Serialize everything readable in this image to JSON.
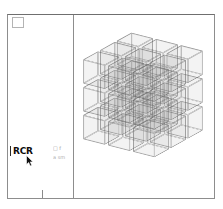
{
  "window": {
    "background_color": "#ffffff",
    "border_color": "#8d8d8d"
  },
  "sidebar": {
    "corner_box_name": "corner-box",
    "label": "RCR",
    "tick_mark": "|",
    "notes": [
      "□ f",
      "a sm"
    ]
  },
  "content": {
    "cursor": "arrow-cursor"
  },
  "chart_data": {
    "type": "scatter",
    "title": "",
    "xlabel": "",
    "ylabel": "",
    "render": "3d-wireframe-cube-lattice",
    "grid": [
      3,
      3,
      3
    ],
    "cube_count": 27,
    "cube_size": 26,
    "spacing": 30,
    "rotation_x_deg": -22,
    "rotation_y_deg": -34,
    "edge_color": "#606060",
    "edge_opacity": 0.4,
    "face_color": "#8c8c8c",
    "face_opacity": 0.055,
    "cubes": [
      {
        "i": 0,
        "j": 0,
        "k": 0
      },
      {
        "i": 1,
        "j": 0,
        "k": 0
      },
      {
        "i": 2,
        "j": 0,
        "k": 0
      },
      {
        "i": 0,
        "j": 1,
        "k": 0
      },
      {
        "i": 1,
        "j": 1,
        "k": 0
      },
      {
        "i": 2,
        "j": 1,
        "k": 0
      },
      {
        "i": 0,
        "j": 2,
        "k": 0
      },
      {
        "i": 1,
        "j": 2,
        "k": 0
      },
      {
        "i": 2,
        "j": 2,
        "k": 0
      },
      {
        "i": 0,
        "j": 0,
        "k": 1
      },
      {
        "i": 1,
        "j": 0,
        "k": 1
      },
      {
        "i": 2,
        "j": 0,
        "k": 1
      },
      {
        "i": 0,
        "j": 1,
        "k": 1
      },
      {
        "i": 1,
        "j": 1,
        "k": 1
      },
      {
        "i": 2,
        "j": 1,
        "k": 1
      },
      {
        "i": 0,
        "j": 2,
        "k": 1
      },
      {
        "i": 1,
        "j": 2,
        "k": 1
      },
      {
        "i": 2,
        "j": 2,
        "k": 1
      },
      {
        "i": 0,
        "j": 0,
        "k": 2
      },
      {
        "i": 1,
        "j": 0,
        "k": 2
      },
      {
        "i": 2,
        "j": 0,
        "k": 2
      },
      {
        "i": 0,
        "j": 1,
        "k": 2
      },
      {
        "i": 1,
        "j": 1,
        "k": 2
      },
      {
        "i": 2,
        "j": 1,
        "k": 2
      },
      {
        "i": 0,
        "j": 2,
        "k": 2
      },
      {
        "i": 1,
        "j": 2,
        "k": 2
      },
      {
        "i": 2,
        "j": 2,
        "k": 2
      }
    ]
  }
}
